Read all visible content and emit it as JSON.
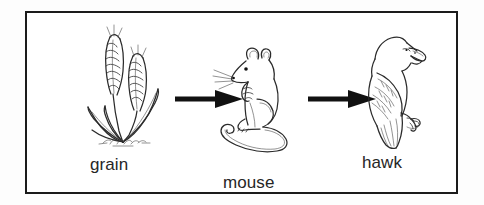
{
  "figure": {
    "kind": "food-chain-diagram",
    "border_color": "#1b1b1b",
    "ink_color": "#2b2b2b",
    "background_color": "#ffffff",
    "label_color": "#262626",
    "direction": "left-to-right"
  },
  "stages": [
    {
      "id": "grain",
      "label": "grain",
      "icon": "wheat-grain-icon",
      "role": "producer",
      "position": 1
    },
    {
      "id": "mouse",
      "label": "mouse",
      "icon": "mouse-icon",
      "role": "primary-consumer",
      "position": 2
    },
    {
      "id": "hawk",
      "label": "hawk",
      "icon": "hawk-icon",
      "role": "secondary-consumer",
      "position": 3
    }
  ],
  "arrows": [
    {
      "id": "arrow-grain-mouse",
      "from": "grain",
      "to": "mouse",
      "glyph": "right-arrow-icon"
    },
    {
      "id": "arrow-mouse-hawk",
      "from": "mouse",
      "to": "hawk",
      "glyph": "right-arrow-icon"
    }
  ]
}
